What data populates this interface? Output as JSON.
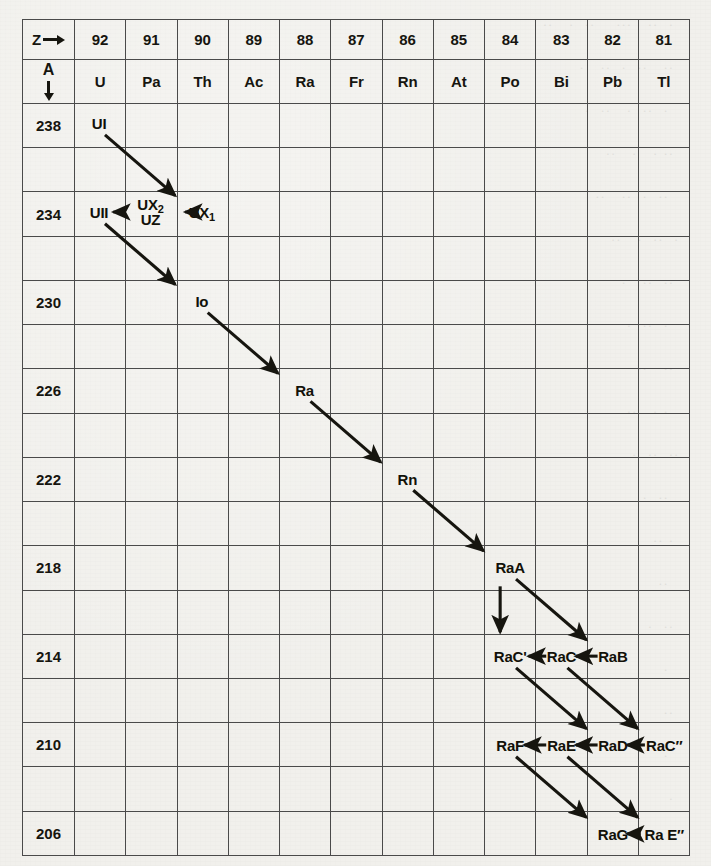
{
  "header": {
    "z_label": "Z",
    "z_arrow_icon": "right-arrow-icon",
    "a_label": "A",
    "a_arrow_icon": "down-arrow-icon",
    "atomic_numbers": [
      "92",
      "91",
      "90",
      "89",
      "88",
      "87",
      "86",
      "85",
      "84",
      "83",
      "82",
      "81"
    ],
    "element_symbols": [
      "U",
      "Pa",
      "Th",
      "Ac",
      "Ra",
      "Fr",
      "Rn",
      "At",
      "Po",
      "Bi",
      "Pb",
      "Tl"
    ]
  },
  "mass_numbers": [
    "238",
    "",
    "234",
    "",
    "230",
    "",
    "226",
    "",
    "222",
    "",
    "218",
    "",
    "214",
    "",
    "210",
    "",
    "206"
  ],
  "nuclides": [
    {
      "id": "UI",
      "text": "UI",
      "z": "92",
      "a": "238",
      "col": 1,
      "row": 0
    },
    {
      "id": "UII",
      "text": "UII",
      "z": "92",
      "a": "234",
      "col": 1,
      "row": 2
    },
    {
      "id": "UX2UZ",
      "text": "UX₂ / UZ",
      "line1": "UX",
      "sub1": "2",
      "line2": "UZ",
      "z": "91",
      "a": "234",
      "col": 2,
      "row": 2
    },
    {
      "id": "UX1",
      "text": "UX₁",
      "base": "UX",
      "sub": "1",
      "z": "90",
      "a": "234",
      "col": 3,
      "row": 2
    },
    {
      "id": "Io",
      "text": "Io",
      "z": "90",
      "a": "230",
      "col": 3,
      "row": 4
    },
    {
      "id": "Ra",
      "text": "Ra",
      "z": "88",
      "a": "226",
      "col": 5,
      "row": 6
    },
    {
      "id": "Rn",
      "text": "Rn",
      "z": "86",
      "a": "222",
      "col": 7,
      "row": 8
    },
    {
      "id": "RaA",
      "text": "RaA",
      "z": "84",
      "a": "218",
      "col": 9,
      "row": 10
    },
    {
      "id": "RaB",
      "text": "RaB",
      "z": "82",
      "a": "214",
      "col": 11,
      "row": 12
    },
    {
      "id": "RaC",
      "text": "RaC",
      "z": "83",
      "a": "214",
      "col": 10,
      "row": 12
    },
    {
      "id": "RaCp",
      "text": "RaC'",
      "z": "84",
      "a": "214",
      "col": 9,
      "row": 12
    },
    {
      "id": "RaCpp",
      "text": "RaC″",
      "z": "81",
      "a": "210",
      "col": 12,
      "row": 14
    },
    {
      "id": "RaD",
      "text": "RaD",
      "z": "82",
      "a": "210",
      "col": 11,
      "row": 14
    },
    {
      "id": "RaE",
      "text": "RaE",
      "z": "83",
      "a": "210",
      "col": 10,
      "row": 14
    },
    {
      "id": "RaF",
      "text": "RaF",
      "z": "84",
      "a": "210",
      "col": 9,
      "row": 14
    },
    {
      "id": "RaEpp",
      "text": "Ra E″",
      "z": "81",
      "a": "206",
      "col": 12,
      "row": 16
    },
    {
      "id": "RaG",
      "text": "RaG",
      "z": "82",
      "a": "206",
      "col": 11,
      "row": 16
    }
  ],
  "decays": [
    {
      "from": "UI",
      "to": "UX1",
      "type": "alpha"
    },
    {
      "from": "UX1",
      "to": "UX2UZ",
      "type": "beta"
    },
    {
      "from": "UX2UZ",
      "to": "UII",
      "type": "beta"
    },
    {
      "from": "UII",
      "to": "Io",
      "type": "alpha"
    },
    {
      "from": "Io",
      "to": "Ra",
      "type": "alpha"
    },
    {
      "from": "Ra",
      "to": "Rn",
      "type": "alpha"
    },
    {
      "from": "Rn",
      "to": "RaA",
      "type": "alpha"
    },
    {
      "from": "RaA",
      "to": "RaB",
      "type": "alpha"
    },
    {
      "from": "RaA",
      "to": "RaCp",
      "type": "alpha-branch"
    },
    {
      "from": "RaB",
      "to": "RaC",
      "type": "beta"
    },
    {
      "from": "RaC",
      "to": "RaCp",
      "type": "beta"
    },
    {
      "from": "RaC",
      "to": "RaCpp",
      "type": "alpha"
    },
    {
      "from": "RaCp",
      "to": "RaD",
      "type": "alpha"
    },
    {
      "from": "RaCpp",
      "to": "RaD",
      "type": "beta"
    },
    {
      "from": "RaD",
      "to": "RaE",
      "type": "beta"
    },
    {
      "from": "RaE",
      "to": "RaF",
      "type": "beta"
    },
    {
      "from": "RaE",
      "to": "RaEpp",
      "type": "alpha"
    },
    {
      "from": "RaF",
      "to": "RaG",
      "type": "alpha"
    },
    {
      "from": "RaEpp",
      "to": "RaG",
      "type": "beta"
    }
  ],
  "colors": {
    "paper": "#f1f0ec",
    "ink": "#16150f",
    "gridline": "#4a4a4a"
  },
  "ghost_lines": [
    "  .  ..   ...    ..  .   ..  ",
    "  ..   ..  .  ..   .",
    "   .  ..  .   ..  . ",
    "  .. .   .   .. ",
    "   ..  .  ..   .. ",
    " .  ..  .   ..  ",
    "  ..  ..   . ",
    "   .  ..  . ",
    "  ..   ..  ",
    "   . .   .. ",
    " ..  ..  . ",
    "   ..  . ",
    "  . ..  ",
    "   ..  ",
    "  ..  . ",
    "   . ",
    "  .. ",
    "   . ",
    "  . "
  ]
}
